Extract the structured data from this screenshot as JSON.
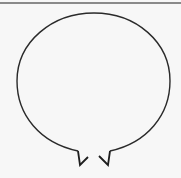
{
  "diagram": {
    "shape": "balloon-outline",
    "colors": {
      "background": "#f7f7f7",
      "stroke": "#2a2a2a",
      "top_rule": "#8a8a8a"
    },
    "outline": {
      "cx": 94,
      "cy": 81,
      "rx": 76,
      "ry": 69
    },
    "notches": [
      {
        "position": "left"
      },
      {
        "position": "right"
      }
    ]
  }
}
